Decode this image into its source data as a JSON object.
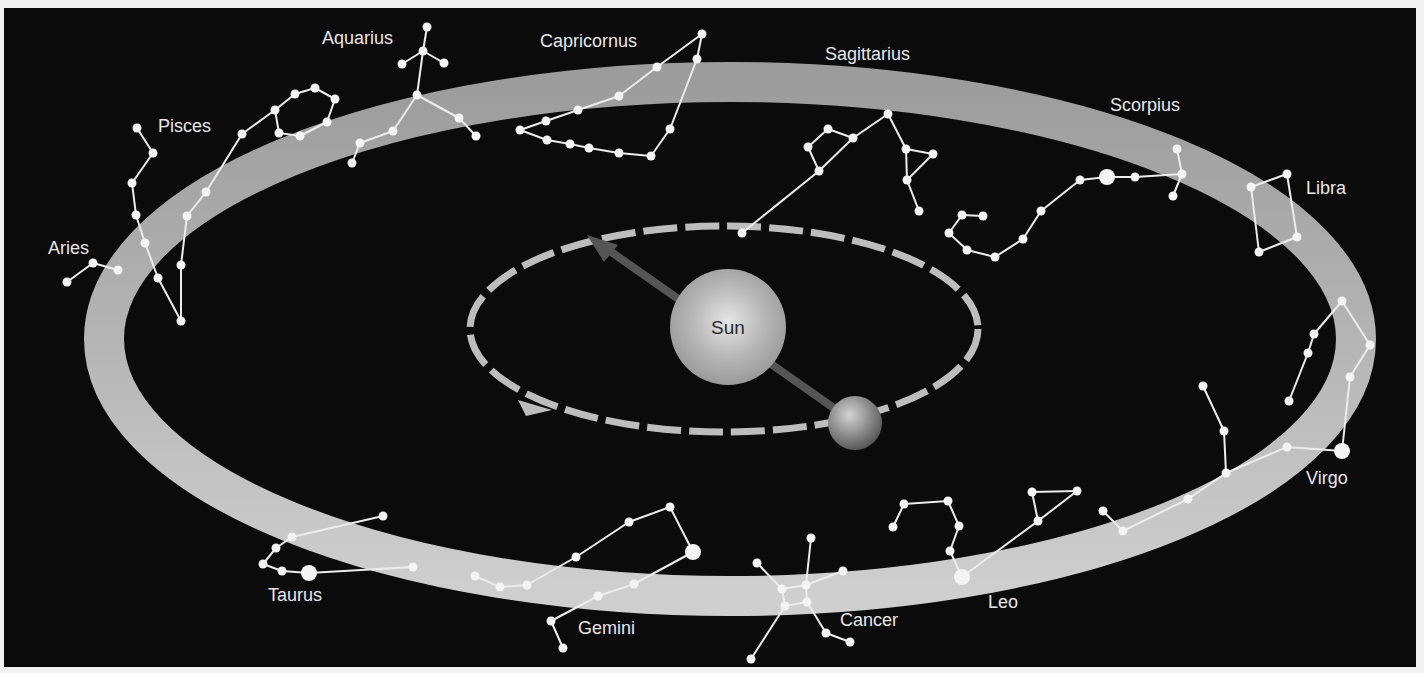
{
  "diagram": {
    "colors": {
      "background": "#0b0b0b",
      "frame": "#f2f2f2",
      "ecliptic_band_top": "#9c9c9c",
      "ecliptic_band_bottom": "#cfcfcf",
      "orbit_dashes": "#bdbdbd",
      "arrow": "#555555",
      "star": "#f4f4f4",
      "label": "#e8e8e8"
    },
    "ecliptic_band": {
      "cx": 730,
      "cy": 339,
      "rx": 626,
      "ry": 257,
      "width": 40
    },
    "earth_orbit": {
      "cx": 724,
      "cy": 329,
      "rx": 254,
      "ry": 103,
      "dashed": true
    },
    "sun": {
      "label": "Sun",
      "cx": 728,
      "cy": 327,
      "r": 58
    },
    "earth": {
      "cx": 855,
      "cy": 423,
      "r": 27
    },
    "sight_arrow": {
      "from": [
        848,
        418
      ],
      "to": [
        587,
        235
      ]
    },
    "orbit_arrow": {
      "at": [
        540,
        407
      ],
      "direction": "counterclockwise-view"
    },
    "constellations": [
      {
        "name": "Aries",
        "label": {
          "text": "Aries",
          "x": 48,
          "y": 254
        },
        "stars": [
          [
            67,
            282
          ],
          [
            93,
            263
          ],
          [
            118,
            270
          ]
        ],
        "lines": [
          [
            0,
            1
          ],
          [
            1,
            2
          ]
        ]
      },
      {
        "name": "Pisces",
        "label": {
          "text": "Pisces",
          "x": 158,
          "y": 132
        },
        "stars": [
          [
            137,
            128
          ],
          [
            153,
            153
          ],
          [
            132,
            183
          ],
          [
            136,
            215
          ],
          [
            145,
            243
          ],
          [
            158,
            278
          ],
          [
            181,
            321
          ],
          [
            181,
            265
          ],
          [
            187,
            216
          ],
          [
            206,
            192
          ],
          [
            242,
            134
          ],
          [
            275,
            110
          ],
          [
            295,
            94
          ],
          [
            315,
            88
          ],
          [
            335,
            99
          ],
          [
            327,
            122
          ],
          [
            300,
            136
          ],
          [
            279,
            133
          ]
        ],
        "lines": [
          [
            0,
            1
          ],
          [
            1,
            2
          ],
          [
            2,
            3
          ],
          [
            3,
            4
          ],
          [
            4,
            5
          ],
          [
            5,
            6
          ],
          [
            6,
            7
          ],
          [
            7,
            8
          ],
          [
            8,
            9
          ],
          [
            9,
            10
          ],
          [
            10,
            11
          ],
          [
            11,
            12
          ],
          [
            12,
            13
          ],
          [
            13,
            14
          ],
          [
            14,
            15
          ],
          [
            15,
            16
          ],
          [
            16,
            17
          ],
          [
            17,
            11
          ]
        ]
      },
      {
        "name": "Aquarius",
        "label": {
          "text": "Aquarius",
          "x": 322,
          "y": 44
        },
        "stars": [
          [
            427,
            27
          ],
          [
            423,
            51
          ],
          [
            402,
            64
          ],
          [
            444,
            63
          ],
          [
            417,
            95
          ],
          [
            459,
            118
          ],
          [
            476,
            136
          ],
          [
            393,
            131
          ],
          [
            360,
            143
          ],
          [
            352,
            163
          ]
        ],
        "lines": [
          [
            0,
            1
          ],
          [
            1,
            2
          ],
          [
            1,
            3
          ],
          [
            1,
            4
          ],
          [
            4,
            5
          ],
          [
            5,
            6
          ],
          [
            4,
            7
          ],
          [
            7,
            8
          ],
          [
            8,
            9
          ]
        ]
      },
      {
        "name": "Capricornus",
        "label": {
          "text": "Capricornus",
          "x": 540,
          "y": 47
        },
        "stars": [
          [
            702,
            34
          ],
          [
            697,
            59
          ],
          [
            657,
            67
          ],
          [
            619,
            96
          ],
          [
            578,
            110
          ],
          [
            546,
            121
          ],
          [
            520,
            130
          ],
          [
            547,
            140
          ],
          [
            570,
            144
          ],
          [
            589,
            148
          ],
          [
            619,
            153
          ],
          [
            651,
            156
          ],
          [
            670,
            129
          ]
        ],
        "lines": [
          [
            0,
            2
          ],
          [
            2,
            3
          ],
          [
            3,
            4
          ],
          [
            4,
            5
          ],
          [
            5,
            6
          ],
          [
            6,
            7
          ],
          [
            7,
            8
          ],
          [
            8,
            9
          ],
          [
            9,
            10
          ],
          [
            10,
            11
          ],
          [
            11,
            12
          ],
          [
            12,
            1
          ],
          [
            1,
            0
          ]
        ]
      },
      {
        "name": "Sagittarius",
        "label": {
          "text": "Sagittarius",
          "x": 825,
          "y": 60
        },
        "stars": [
          [
            888,
            114
          ],
          [
            853,
            138
          ],
          [
            828,
            129
          ],
          [
            808,
            147
          ],
          [
            819,
            171
          ],
          [
            742,
            233
          ],
          [
            906,
            149
          ],
          [
            933,
            154
          ],
          [
            907,
            180
          ],
          [
            919,
            211
          ]
        ],
        "lines": [
          [
            0,
            1
          ],
          [
            1,
            2
          ],
          [
            2,
            3
          ],
          [
            3,
            4
          ],
          [
            4,
            1
          ],
          [
            4,
            5
          ],
          [
            0,
            6
          ],
          [
            6,
            7
          ],
          [
            7,
            8
          ],
          [
            6,
            8
          ],
          [
            8,
            9
          ]
        ]
      },
      {
        "name": "Scorpius",
        "label": {
          "text": "Scorpius",
          "x": 1110,
          "y": 111
        },
        "stars": [
          [
            1177,
            149
          ],
          [
            1182,
            174
          ],
          [
            1173,
            196
          ],
          [
            1135,
            177
          ],
          [
            1107,
            177
          ],
          [
            1080,
            180
          ],
          [
            1041,
            211
          ],
          [
            1023,
            239
          ],
          [
            995,
            257
          ],
          [
            967,
            250
          ],
          [
            949,
            233
          ],
          [
            962,
            215
          ],
          [
            983,
            216
          ]
        ],
        "big": [
          4
        ],
        "lines": [
          [
            0,
            1
          ],
          [
            1,
            2
          ],
          [
            1,
            3
          ],
          [
            3,
            4
          ],
          [
            4,
            5
          ],
          [
            5,
            6
          ],
          [
            6,
            7
          ],
          [
            7,
            8
          ],
          [
            8,
            9
          ],
          [
            9,
            10
          ],
          [
            10,
            11
          ],
          [
            11,
            12
          ]
        ]
      },
      {
        "name": "Libra",
        "label": {
          "text": "Libra",
          "x": 1306,
          "y": 194
        },
        "stars": [
          [
            1251,
            187
          ],
          [
            1287,
            174
          ],
          [
            1297,
            237
          ],
          [
            1259,
            252
          ]
        ],
        "lines": [
          [
            0,
            1
          ],
          [
            1,
            2
          ],
          [
            2,
            3
          ],
          [
            3,
            0
          ]
        ]
      },
      {
        "name": "Virgo",
        "label": {
          "text": "Virgo",
          "x": 1306,
          "y": 484
        },
        "stars": [
          [
            1342,
            301
          ],
          [
            1370,
            345
          ],
          [
            1350,
            377
          ],
          [
            1342,
            451
          ],
          [
            1314,
            334
          ],
          [
            1308,
            353
          ],
          [
            1289,
            401
          ],
          [
            1287,
            447
          ],
          [
            1226,
            473
          ],
          [
            1224,
            431
          ],
          [
            1203,
            386
          ],
          [
            1188,
            499
          ],
          [
            1123,
            531
          ],
          [
            1103,
            511
          ]
        ],
        "big": [
          3
        ],
        "lines": [
          [
            0,
            1
          ],
          [
            1,
            2
          ],
          [
            2,
            3
          ],
          [
            0,
            4
          ],
          [
            4,
            5
          ],
          [
            5,
            6
          ],
          [
            3,
            7
          ],
          [
            7,
            8
          ],
          [
            8,
            9
          ],
          [
            9,
            10
          ],
          [
            8,
            11
          ],
          [
            11,
            12
          ],
          [
            12,
            13
          ]
        ]
      },
      {
        "name": "Leo",
        "label": {
          "text": "Leo",
          "x": 988,
          "y": 608
        },
        "stars": [
          [
            893,
            527
          ],
          [
            904,
            504
          ],
          [
            948,
            501
          ],
          [
            959,
            526
          ],
          [
            950,
            551
          ],
          [
            962,
            577
          ],
          [
            1038,
            521
          ],
          [
            1032,
            492
          ],
          [
            1077,
            491
          ]
        ],
        "big": [
          5
        ],
        "lines": [
          [
            0,
            1
          ],
          [
            1,
            2
          ],
          [
            2,
            3
          ],
          [
            3,
            4
          ],
          [
            4,
            5
          ],
          [
            5,
            6
          ],
          [
            6,
            8
          ],
          [
            8,
            7
          ],
          [
            7,
            6
          ]
        ]
      },
      {
        "name": "Cancer",
        "label": {
          "text": "Cancer",
          "x": 840,
          "y": 626
        },
        "stars": [
          [
            811,
            538
          ],
          [
            806,
            585
          ],
          [
            782,
            589
          ],
          [
            757,
            563
          ],
          [
            843,
            571
          ],
          [
            785,
            606
          ],
          [
            807,
            602
          ],
          [
            826,
            633
          ],
          [
            850,
            642
          ],
          [
            751,
            659
          ]
        ],
        "lines": [
          [
            0,
            1
          ],
          [
            1,
            2
          ],
          [
            2,
            3
          ],
          [
            1,
            4
          ],
          [
            2,
            5
          ],
          [
            5,
            6
          ],
          [
            6,
            1
          ],
          [
            6,
            7
          ],
          [
            7,
            8
          ],
          [
            5,
            9
          ]
        ]
      },
      {
        "name": "Gemini",
        "label": {
          "text": "Gemini",
          "x": 578,
          "y": 634
        },
        "stars": [
          [
            670,
            507
          ],
          [
            629,
            522
          ],
          [
            576,
            557
          ],
          [
            527,
            585
          ],
          [
            500,
            587
          ],
          [
            475,
            576
          ],
          [
            693,
            552
          ],
          [
            634,
            584
          ],
          [
            598,
            596
          ],
          [
            551,
            621
          ],
          [
            563,
            648
          ]
        ],
        "big": [
          6
        ],
        "lines": [
          [
            0,
            1
          ],
          [
            1,
            2
          ],
          [
            2,
            3
          ],
          [
            3,
            4
          ],
          [
            4,
            5
          ],
          [
            0,
            6
          ],
          [
            6,
            7
          ],
          [
            7,
            8
          ],
          [
            8,
            9
          ],
          [
            9,
            10
          ]
        ]
      },
      {
        "name": "Taurus",
        "label": {
          "text": "Taurus",
          "x": 268,
          "y": 601
        },
        "stars": [
          [
            383,
            516
          ],
          [
            292,
            537
          ],
          [
            276,
            548
          ],
          [
            263,
            564
          ],
          [
            282,
            571
          ],
          [
            309,
            573
          ],
          [
            413,
            567
          ]
        ],
        "big": [
          5
        ],
        "lines": [
          [
            0,
            1
          ],
          [
            1,
            2
          ],
          [
            2,
            3
          ],
          [
            3,
            4
          ],
          [
            4,
            5
          ],
          [
            5,
            6
          ]
        ]
      }
    ]
  }
}
